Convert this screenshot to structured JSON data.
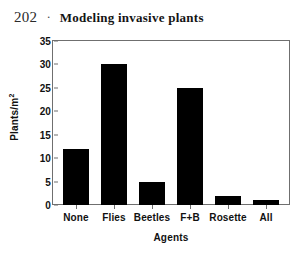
{
  "header": {
    "folio": "202",
    "separator": "·",
    "title": "Modeling invasive plants"
  },
  "chart_data": {
    "type": "bar",
    "title": "",
    "categories": [
      "None",
      "Flies",
      "Beetles",
      "F+B",
      "Rosette",
      "All"
    ],
    "values": [
      12,
      30,
      5,
      25,
      2,
      1
    ],
    "xlabel": "Agents",
    "ylabel": "Plants/m",
    "ylabel_exponent": "2",
    "ylim": [
      0,
      35
    ],
    "yticks": [
      35,
      30,
      25,
      20,
      15,
      10,
      5,
      0
    ],
    "ytick_labels": [
      "35",
      "30",
      "25",
      "20",
      "15",
      "10",
      "5",
      "0"
    ],
    "grid": false,
    "legend": false,
    "bar_color": "#000000",
    "frame_color": "#6f6f6f"
  }
}
